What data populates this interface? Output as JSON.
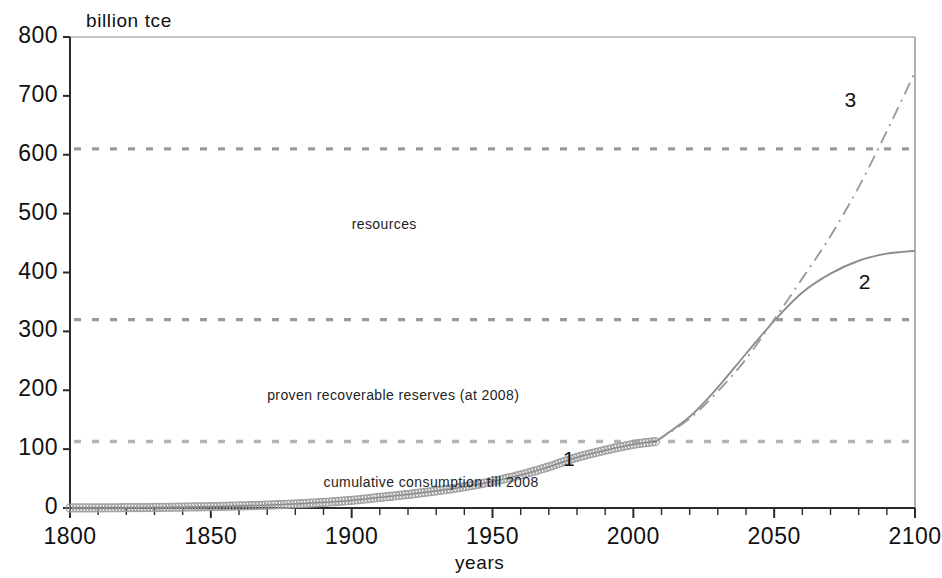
{
  "chart_data": {
    "type": "line",
    "title": "",
    "xlabel": "years",
    "ylabel": "billion tce",
    "ylabel_position": "top-left-inside",
    "xlim": [
      1800,
      2100
    ],
    "ylim": [
      0,
      800
    ],
    "xticks": [
      1800,
      1850,
      1900,
      1950,
      2000,
      2050,
      2100
    ],
    "yticks": [
      0,
      100,
      200,
      300,
      400,
      500,
      600,
      700,
      800
    ],
    "xtick_labels": [
      "1800",
      "1850",
      "1900",
      "1950",
      "2000",
      "2050",
      "2100"
    ],
    "ytick_labels": [
      "0",
      "100",
      "200",
      "300",
      "400",
      "500",
      "600",
      "700",
      "800"
    ],
    "x_minor_tick_step": 10,
    "grid": false,
    "legend": "none",
    "reference_lines": [
      {
        "name": "resources-line",
        "value": 610,
        "style": "dashed",
        "color": "#9a9a9a",
        "label": "resources",
        "label_x": 1900,
        "label_y": 480
      },
      {
        "name": "proven-reserves-line",
        "value": 320,
        "style": "dashed",
        "color": "#9a9a9a",
        "label": "proven recoverable reserves  (at 2008)",
        "label_x": 1870,
        "label_y": 190
      },
      {
        "name": "cumulative-consumption-line",
        "value": 113,
        "style": "dashed",
        "color": "#b4b4b4",
        "label": "cumulative consumption till 2008",
        "label_x": 1890,
        "label_y": 42
      }
    ],
    "series": [
      {
        "name": "1",
        "label": "1",
        "description": "cumulative consumption till 2008 (historical)",
        "style": "markers-thick",
        "color": "#9e9e9e",
        "label_x": 1975,
        "label_y": 80,
        "x": [
          1800,
          1810,
          1820,
          1830,
          1840,
          1850,
          1860,
          1870,
          1880,
          1890,
          1900,
          1910,
          1920,
          1930,
          1940,
          1950,
          1960,
          1970,
          1980,
          1990,
          2000,
          2008
        ],
        "values": [
          0,
          0.2,
          0.5,
          0.9,
          1.5,
          2.3,
          3.4,
          4.9,
          6.9,
          9.5,
          13,
          18,
          23,
          29,
          36,
          45,
          56,
          70,
          86,
          98,
          108,
          113
        ]
      },
      {
        "name": "2",
        "label": "2",
        "description": "lower projection, plateauing",
        "style": "solid",
        "color": "#8c8c8c",
        "label_x": 2080,
        "label_y": 380,
        "x": [
          2008,
          2020,
          2030,
          2040,
          2050,
          2060,
          2070,
          2080,
          2090,
          2100
        ],
        "values": [
          113,
          155,
          205,
          262,
          318,
          366,
          398,
          420,
          432,
          437
        ]
      },
      {
        "name": "3",
        "label": "3",
        "description": "upper projection, continuing growth",
        "style": "dash-dot",
        "color": "#9a9a9a",
        "label_x": 2075,
        "label_y": 690,
        "x": [
          2008,
          2020,
          2030,
          2040,
          2050,
          2060,
          2070,
          2080,
          2090,
          2100
        ],
        "values": [
          113,
          152,
          198,
          253,
          320,
          390,
          462,
          545,
          640,
          740
        ]
      }
    ]
  },
  "colors": {
    "axis": "#2b2b2b",
    "text": "#1a1a1a",
    "series_gray": "#9a9a9a",
    "dashed_gray": "#9a9a9a",
    "background": "#ffffff"
  }
}
